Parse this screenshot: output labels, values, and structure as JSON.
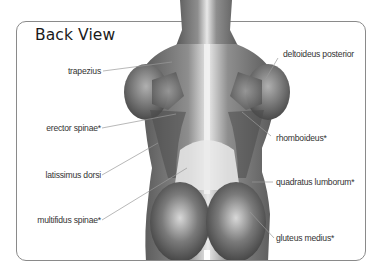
{
  "title": "Back View",
  "labels": {
    "trapezius": "trapezius",
    "erector_spinae": "erector spinae*",
    "latissimus_dorsi": "latissimus dorsi",
    "multifidus_spinae": "multifidus spinae*",
    "deltoideus_posterior": "deltoideus posterior",
    "rhomboideus": "rhomboideus*",
    "quadratus_lumborum": "quadratus lumborum*",
    "gluteus_medius": "gluteus medius*"
  },
  "colors": {
    "border": "#8a8a8a",
    "leader_line": "#9a9a9a",
    "label_text": "#333333",
    "title_text": "#1a1a1a"
  }
}
